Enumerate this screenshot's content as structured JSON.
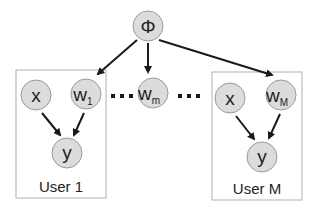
{
  "diagram": {
    "type": "graphical-model",
    "nodes": {
      "phi": {
        "label": "Φ"
      },
      "w_m": {
        "label": "w",
        "sub": "m"
      },
      "left_x": {
        "label": "x"
      },
      "left_w": {
        "label": "w",
        "sub": "1"
      },
      "left_y": {
        "label": "y"
      },
      "right_x": {
        "label": "x"
      },
      "right_w": {
        "label": "w",
        "sub": "M"
      },
      "right_y": {
        "label": "y"
      }
    },
    "plates": {
      "left": {
        "label": "User 1"
      },
      "right": {
        "label": "User M"
      }
    },
    "ellipsis": "...",
    "edges": [
      [
        "phi",
        "left_w"
      ],
      [
        "phi",
        "w_m"
      ],
      [
        "phi",
        "right_w"
      ],
      [
        "left_x",
        "left_y"
      ],
      [
        "left_w",
        "left_y"
      ],
      [
        "right_x",
        "right_y"
      ],
      [
        "right_w",
        "right_y"
      ]
    ]
  }
}
